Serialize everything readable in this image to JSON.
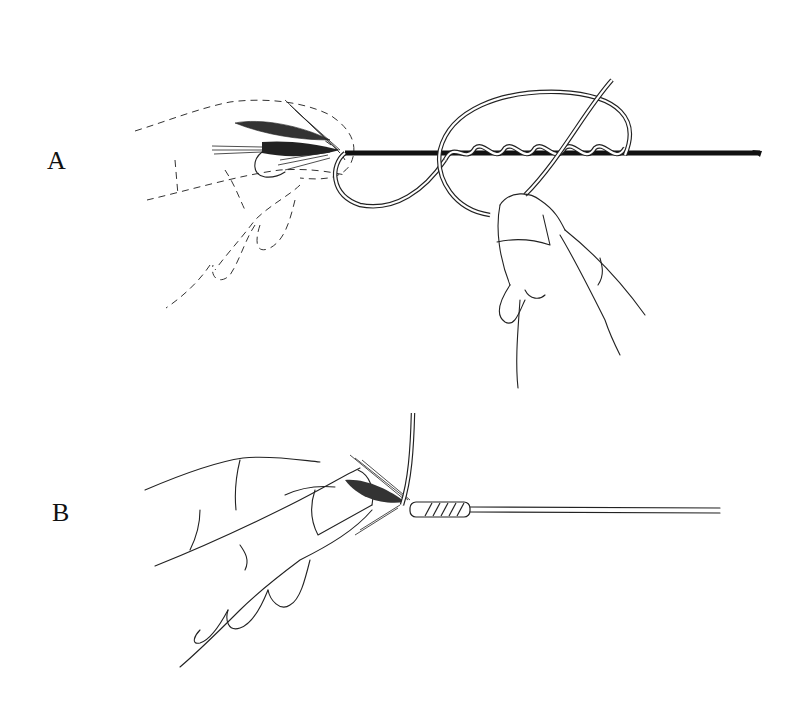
{
  "figure": {
    "steps": [
      {
        "label": "A",
        "caption": ""
      },
      {
        "label": "B",
        "caption": ""
      }
    ]
  },
  "colors": {
    "background": "#ffffff",
    "ink": "#111111"
  }
}
